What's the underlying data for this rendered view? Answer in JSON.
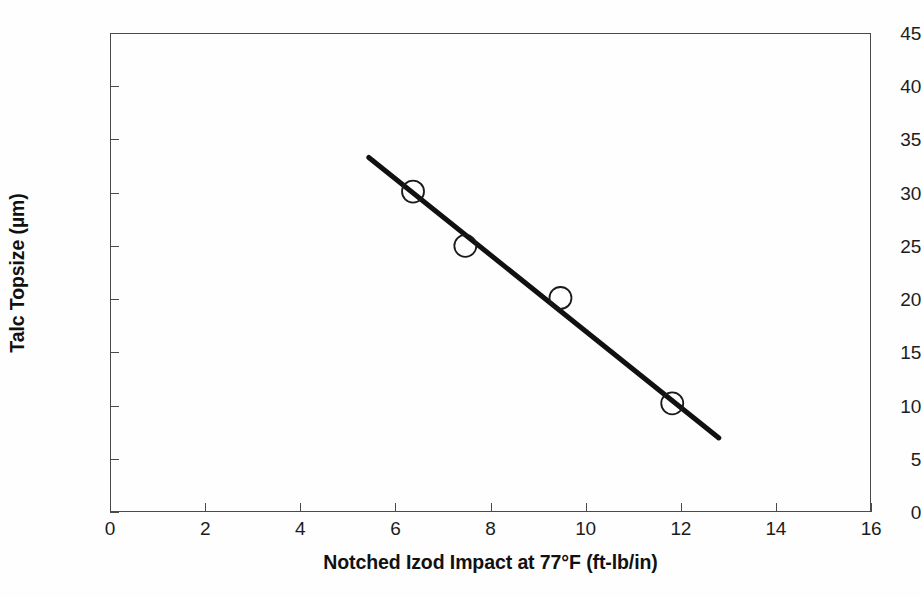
{
  "chart_data": {
    "type": "scatter",
    "title": "",
    "subtitle": "",
    "xlabel": "Notched Izod Impact at 77°F (ft-lb/in)",
    "ylabel": "Talc Topsize (µm)",
    "xlim": [
      0,
      16
    ],
    "ylim": [
      0,
      45
    ],
    "xticks": [
      0,
      2,
      4,
      6,
      8,
      10,
      12,
      14,
      16
    ],
    "yticks": [
      0,
      5,
      10,
      15,
      20,
      25,
      30,
      35,
      40,
      45
    ],
    "xtick_labels": [
      "0",
      "2",
      "4",
      "6",
      "8",
      "10",
      "12",
      "14",
      "16"
    ],
    "ytick_labels": [
      "0",
      "5",
      "10",
      "15",
      "20",
      "25",
      "30",
      "35",
      "40",
      "45"
    ],
    "grid": false,
    "legend": null,
    "legend_position": "none",
    "marker_style": "open-circle",
    "marker_color": "#1a1a1a",
    "marker_fill": "none",
    "line_color": "#111111",
    "frame_color": "#4a4a4a",
    "background_color": "#fefefe",
    "series": [
      {
        "name": "Talc topsize vs notched Izod impact",
        "marker": "open-circle",
        "points": [
          {
            "x": 6.35,
            "y": 30.2
          },
          {
            "x": 7.45,
            "y": 25.1
          },
          {
            "x": 9.45,
            "y": 20.2
          },
          {
            "x": 11.8,
            "y": 10.3
          }
        ]
      }
    ],
    "trendline": {
      "name": "linear fit",
      "type": "line",
      "x_start": 5.42,
      "y_start": 33.4,
      "x_end": 12.78,
      "y_end": 7.05,
      "color": "#111111",
      "width_px": 5
    },
    "annotations": []
  }
}
